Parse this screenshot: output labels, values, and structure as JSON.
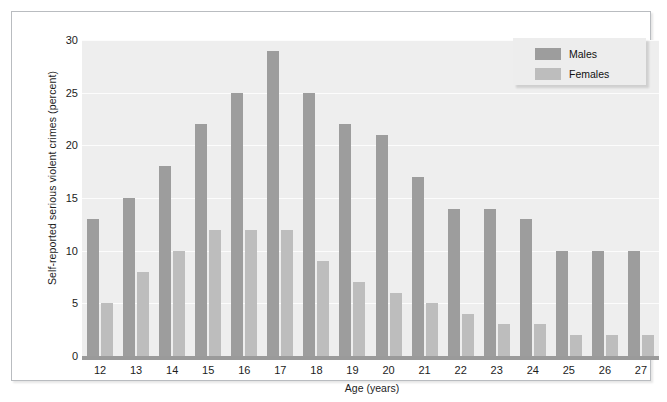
{
  "chart_data": {
    "type": "bar",
    "title": "",
    "xlabel": "Age (years)",
    "ylabel": "Self-reported serious violent crimes (percent)",
    "categories": [
      "12",
      "13",
      "14",
      "15",
      "16",
      "17",
      "18",
      "19",
      "20",
      "21",
      "22",
      "23",
      "24",
      "25",
      "26",
      "27"
    ],
    "series": [
      {
        "name": "Males",
        "color": "#9d9d9d",
        "values": [
          13,
          15,
          18,
          22,
          25,
          29,
          25,
          22,
          21,
          17,
          14,
          14,
          13,
          10,
          10,
          10
        ]
      },
      {
        "name": "Females",
        "color": "#bdbdbd",
        "values": [
          5,
          8,
          10,
          12,
          12,
          12,
          9,
          7,
          6,
          5,
          4,
          3,
          3,
          2,
          2,
          2
        ]
      }
    ],
    "ylim": [
      0,
      30
    ],
    "yticks": [
      0,
      5,
      10,
      15,
      20,
      25,
      30
    ],
    "ytick_labels": [
      "0",
      "5",
      "10",
      "15",
      "20",
      "25",
      "30"
    ],
    "grid": true,
    "legend_position": "top-right",
    "plot_background": "#eeeeee",
    "gridline_color": "#fcfcfc"
  }
}
